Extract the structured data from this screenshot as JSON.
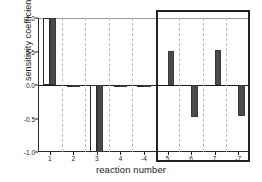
{
  "chart_data": {
    "type": "bar",
    "title": "",
    "xlabel": "reaction number",
    "ylabel": "sensitivity coefficient",
    "categories": [
      "1",
      "2",
      "3",
      "4",
      "-4",
      "5",
      "6",
      "7",
      "-7"
    ],
    "ylim": [
      -1.0,
      1.0
    ],
    "yticks": [
      1.0,
      0.5,
      0.0,
      -0.5,
      -1.0
    ],
    "ytick_labels": [
      "1.0",
      "0.5",
      "0.0",
      "-0.5",
      "-1.0"
    ],
    "grid": "vertical-dashed",
    "legend": "none",
    "series": [
      {
        "name": "light",
        "style": "white-filled-black-outline",
        "color": "#ffffff",
        "edge_color": "#2b2b2b",
        "values": [
          1.0,
          -0.02,
          -1.0,
          -0.01,
          -0.01,
          0.0,
          0.0,
          0.0,
          0.0
        ]
      },
      {
        "name": "dark",
        "style": "dark-gray-filled",
        "color": "#4a4a4a",
        "edge_color": "#3a3a3a",
        "values": [
          1.0,
          -0.02,
          -1.0,
          -0.01,
          -0.01,
          0.51,
          -0.48,
          0.52,
          -0.47
        ]
      }
    ],
    "annotations": [
      {
        "kind": "highlight-rectangle",
        "label": "",
        "covers_categories": [
          "5",
          "6",
          "7",
          "-7"
        ],
        "color": "#222222"
      }
    ]
  },
  "axes": {
    "ylabel": "sensitivity coefficient",
    "xlabel": "reaction number"
  }
}
